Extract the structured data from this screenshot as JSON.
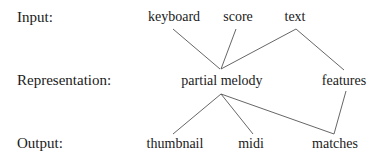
{
  "diagram": {
    "rows": [
      {
        "id": "input",
        "label": "Input:"
      },
      {
        "id": "representation",
        "label": "Representation:"
      },
      {
        "id": "output",
        "label": "Output:"
      }
    ],
    "nodes": {
      "keyboard": "keyboard",
      "score": "score",
      "text": "text",
      "partial_melody": "partial melody",
      "features": "features",
      "thumbnail": "thumbnail",
      "midi": "midi",
      "matches": "matches"
    },
    "edges": [
      {
        "from": "keyboard",
        "to": "partial melody"
      },
      {
        "from": "score",
        "to": "partial melody"
      },
      {
        "from": "text",
        "to": "partial melody"
      },
      {
        "from": "text",
        "to": "features"
      },
      {
        "from": "partial melody",
        "to": "thumbnail"
      },
      {
        "from": "partial melody",
        "to": "midi"
      },
      {
        "from": "partial melody",
        "to": "matches"
      },
      {
        "from": "features",
        "to": "matches"
      }
    ],
    "line_color": "#555555"
  }
}
